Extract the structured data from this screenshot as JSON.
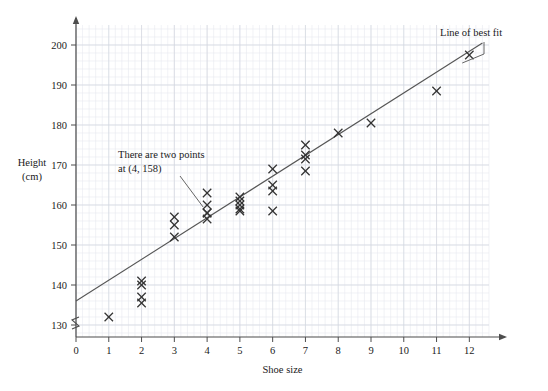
{
  "chart_data": {
    "type": "scatter",
    "title": "",
    "xlabel": "Shoe size",
    "ylabel": "Height (cm)",
    "ylabel_line1": "Height",
    "ylabel_line2": "(cm)",
    "xlim": [
      0,
      12.6
    ],
    "ylim": [
      127,
      205
    ],
    "xticks": [
      0,
      1,
      2,
      3,
      4,
      5,
      6,
      7,
      8,
      9,
      10,
      11,
      12
    ],
    "yticks": [
      130,
      140,
      150,
      160,
      170,
      180,
      190,
      200
    ],
    "xtick_labels": [
      "0",
      "1",
      "2",
      "3",
      "4",
      "5",
      "6",
      "7",
      "8",
      "9",
      "10",
      "11",
      "12"
    ],
    "ytick_labels": [
      "130",
      "140",
      "150",
      "160",
      "170",
      "180",
      "190",
      "200"
    ],
    "grid": true,
    "grid_minor_step_x": 0.2,
    "grid_minor_step_y": 2,
    "axis_break": true,
    "legend": "none",
    "points": [
      {
        "x": 1,
        "y": 132
      },
      {
        "x": 2,
        "y": 141
      },
      {
        "x": 2,
        "y": 140
      },
      {
        "x": 2,
        "y": 137
      },
      {
        "x": 2,
        "y": 135.5
      },
      {
        "x": 3,
        "y": 157
      },
      {
        "x": 3,
        "y": 155
      },
      {
        "x": 3,
        "y": 152
      },
      {
        "x": 4,
        "y": 163
      },
      {
        "x": 4,
        "y": 160
      },
      {
        "x": 4,
        "y": 158
      },
      {
        "x": 4,
        "y": 158
      },
      {
        "x": 4,
        "y": 156.5
      },
      {
        "x": 5,
        "y": 162
      },
      {
        "x": 5,
        "y": 161
      },
      {
        "x": 5,
        "y": 160
      },
      {
        "x": 5,
        "y": 159
      },
      {
        "x": 5,
        "y": 158.5
      },
      {
        "x": 6,
        "y": 169
      },
      {
        "x": 6,
        "y": 165
      },
      {
        "x": 6,
        "y": 163.5
      },
      {
        "x": 6,
        "y": 158.5
      },
      {
        "x": 7,
        "y": 175
      },
      {
        "x": 7,
        "y": 172.5
      },
      {
        "x": 7,
        "y": 171.5
      },
      {
        "x": 7,
        "y": 168.5
      },
      {
        "x": 8,
        "y": 178
      },
      {
        "x": 9,
        "y": 180.5
      },
      {
        "x": 11,
        "y": 188.5
      },
      {
        "x": 12,
        "y": 197.5
      }
    ],
    "best_fit_line": {
      "label": "Line of best fit",
      "x1": 0,
      "y1": 136,
      "x2": 12.4,
      "y2": 200.5
    },
    "annotations": [
      {
        "name": "two-points-note",
        "line1": "There are two points",
        "line2": "at (4, 158)",
        "points_to": {
          "x": 4,
          "y": 158
        }
      },
      {
        "name": "line-of-best-fit-note",
        "line1": "Line of best fit",
        "points_to": {
          "x": 11.6,
          "y": 196
        }
      }
    ],
    "colors": {
      "axis": "#4d4d4d",
      "grid_minor": "#e8eaf0",
      "grid_major": "#d3d7e0",
      "marker": "#333333",
      "line": "#555555",
      "text": "#1a1a1a"
    }
  }
}
